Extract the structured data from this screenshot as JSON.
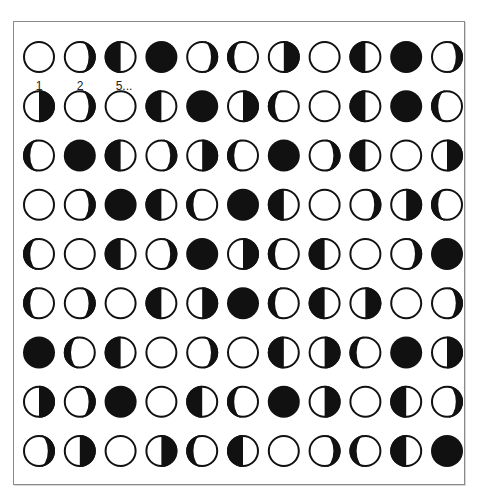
{
  "labels": [
    {
      "text": "1",
      "col": 0
    },
    {
      "text": "2",
      "col": 1
    },
    {
      "text": "5...",
      "col": 2
    }
  ],
  "colors": {
    "ink": "#111111",
    "paper": "#ffffff",
    "frame": "#8a8a8a"
  },
  "phase_legend": {
    "F": "full (white)",
    "N": "new (black)",
    "LH": "left half dark",
    "RH": "right half dark",
    "LC": "left crescent dark",
    "RC": "right crescent dark"
  },
  "grid": [
    [
      "F",
      "RC",
      "LH",
      "N",
      "RC",
      "LC",
      "RH",
      "F",
      "LH",
      "N",
      "RC"
    ],
    [
      "RH",
      "RC",
      "F",
      "LH",
      "N",
      "RH",
      "LC",
      "F",
      "LH",
      "N",
      "LC"
    ],
    [
      "LC",
      "N",
      "LH",
      "RC",
      "RH",
      "LC",
      "N",
      "RC",
      "LH",
      "F",
      "RH"
    ],
    [
      "F",
      "RC",
      "N",
      "LH",
      "LC",
      "N",
      "LH",
      "F",
      "RC",
      "RH",
      "LC"
    ],
    [
      "LC",
      "F",
      "LH",
      "RC",
      "N",
      "RH",
      "LC",
      "LH",
      "F",
      "RC",
      "N"
    ],
    [
      "LC",
      "RC",
      "F",
      "LH",
      "RH",
      "N",
      "LC",
      "LH",
      "RH",
      "F",
      "RC"
    ],
    [
      "N",
      "LC",
      "LH",
      "F",
      "RC",
      "F",
      "LH",
      "RH",
      "LC",
      "N",
      "RH"
    ],
    [
      "RH",
      "RC",
      "N",
      "F",
      "LH",
      "LC",
      "N",
      "RH",
      "F",
      "LH",
      "RC"
    ],
    [
      "RC",
      "RH",
      "F",
      "RH",
      "LC",
      "LH",
      "F",
      "RC",
      "LC",
      "LH",
      "N"
    ]
  ]
}
